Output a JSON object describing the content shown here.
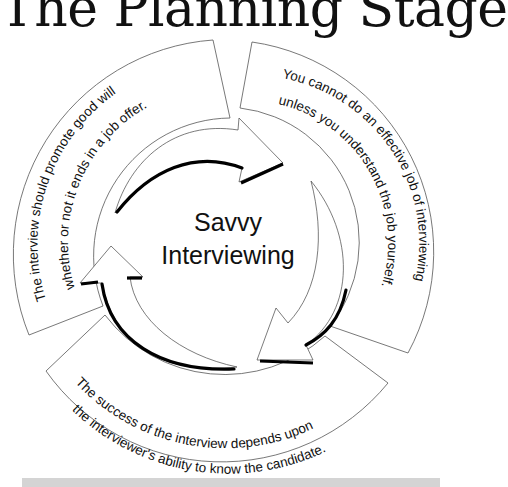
{
  "title": "The Planning Stage",
  "center": {
    "line1": "Savvy",
    "line2": "Interviewing"
  },
  "segments": [
    {
      "position": "top-left",
      "line1": "The interview should promote good will",
      "line2": "whether or not it ends in a job offer."
    },
    {
      "position": "top-right",
      "line1": "You cannot do an effective job of interviewing",
      "line2": "unless you understand the job yourself."
    },
    {
      "position": "bottom",
      "line1": "The success of the interview depends upon",
      "line2": "the  interviewer's ability to know the candidate."
    }
  ],
  "colors": {
    "text": "#111111",
    "outline": "#555555",
    "shadow": "#000000",
    "footer_bar": "#d4d4d4"
  }
}
